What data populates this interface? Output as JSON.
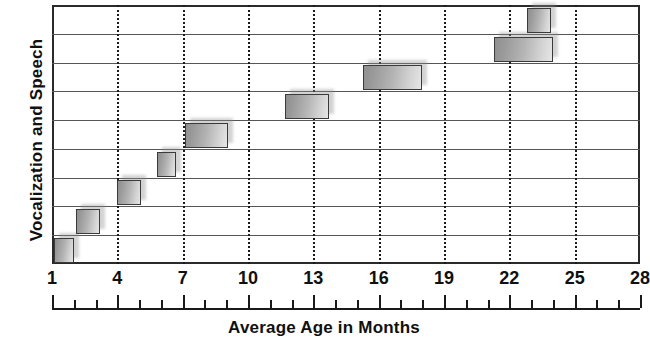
{
  "chart_data": {
    "type": "bar",
    "orientation": "horizontal",
    "title": "",
    "xlabel": "Average Age in Months",
    "ylabel": "Vocalization and Speech",
    "xlim": [
      1,
      28
    ],
    "ylim": [
      0,
      9
    ],
    "grid": {
      "vertical": "dotted at major x ticks",
      "horizontal": "solid row separators",
      "rows": 9
    },
    "x_major_ticks": [
      1,
      4,
      7,
      10,
      13,
      16,
      19,
      22,
      25,
      28
    ],
    "x_tick_labels": [
      "1",
      "4",
      "7",
      "10",
      "13",
      "16",
      "19",
      "22",
      "25",
      "28"
    ],
    "x_minor_tick_step": 1,
    "y_tick_labels": [],
    "legend": null,
    "bar_style": {
      "fill": "gray-gradient",
      "edge_color": "#3a3a3a",
      "shadow": true
    },
    "note": "Each horizontal bar spans the average age range (in months) for one vocalization and speech milestone; rows are ordered earliest at the bottom to latest at the top.",
    "bars": [
      {
        "row": 1,
        "start": 1.1,
        "end": 2.0,
        "label": ""
      },
      {
        "row": 2,
        "start": 2.1,
        "end": 3.2,
        "label": ""
      },
      {
        "row": 3,
        "start": 4.0,
        "end": 5.1,
        "label": ""
      },
      {
        "row": 4,
        "start": 5.8,
        "end": 6.7,
        "label": ""
      },
      {
        "row": 5,
        "start": 7.1,
        "end": 9.1,
        "label": ""
      },
      {
        "row": 6,
        "start": 11.7,
        "end": 13.7,
        "label": ""
      },
      {
        "row": 7,
        "start": 15.3,
        "end": 18.0,
        "label": ""
      },
      {
        "row": 8,
        "start": 21.3,
        "end": 24.0,
        "label": ""
      },
      {
        "row": 9,
        "start": 22.8,
        "end": 23.9,
        "label": ""
      }
    ]
  },
  "axes": {
    "y_title": "Vocalization and Speech",
    "x_title": "Average Age in Months"
  },
  "colors": {
    "frame": "#2a2a2a",
    "row_separator": "#555555",
    "gridline": "#1a1a1a",
    "bar_edge": "#3a3a3a",
    "bar_fill_light": "#e6e6e6",
    "bar_fill_dark": "#8f8f8f",
    "text": "#101010",
    "background": "#ffffff"
  }
}
